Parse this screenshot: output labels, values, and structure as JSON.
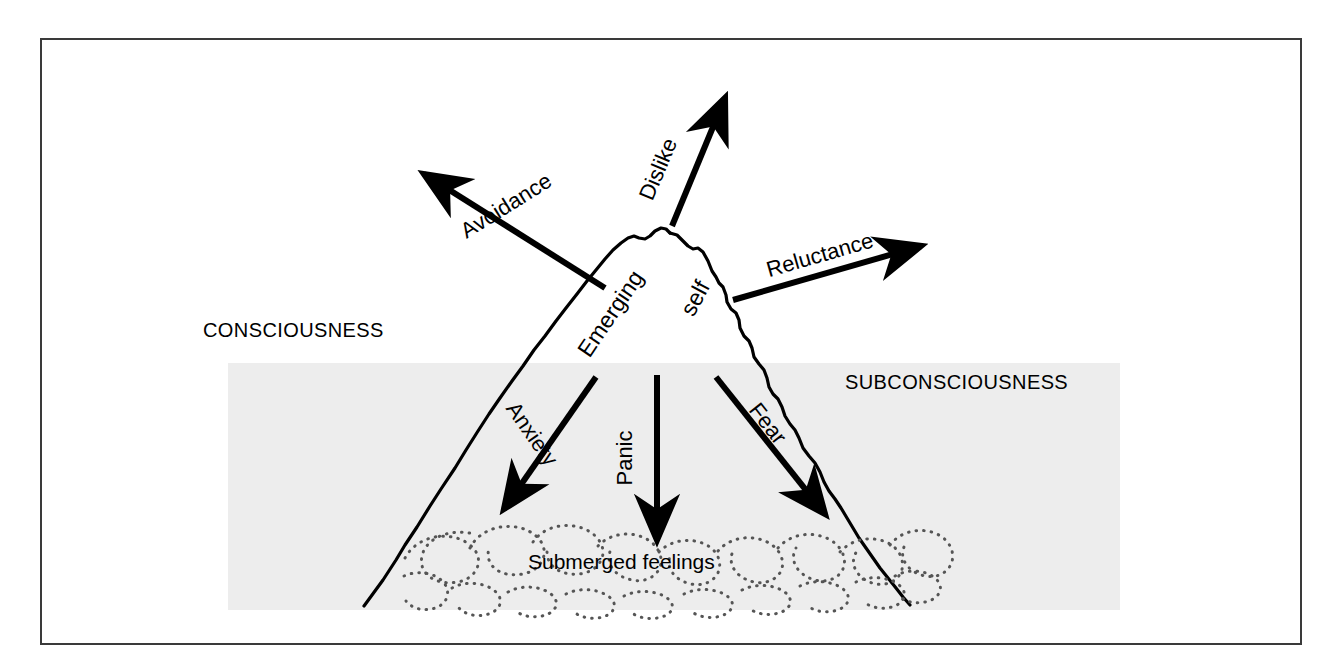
{
  "figure": {
    "type": "conceptual-diagram",
    "background_color": "#ffffff",
    "frame_color": "#3a3a3a",
    "band_color": "#ededed",
    "ink_color": "#000000"
  },
  "regions": {
    "consciousness_label": "CONSCIOUSNESS",
    "subconsciousness_label": "SUBCONSCIOUSNESS",
    "waterline_note": "horizontal grey band marks the subconscious zone"
  },
  "peak": {
    "label_part_one": "Emerging",
    "label_part_two": "self",
    "full_label": "Emerging self"
  },
  "submerged": {
    "label": "Submerged feelings"
  },
  "arrows_up": [
    {
      "label": "Avoidance",
      "direction": "up-left",
      "from": [
        605,
        288
      ],
      "to": [
        418,
        170
      ],
      "label_angle": -32
    },
    {
      "label": "Dislike",
      "direction": "up",
      "from": [
        672,
        226
      ],
      "to": [
        728,
        92
      ],
      "label_angle": -67
    },
    {
      "label": "Reluctance",
      "direction": "up-right",
      "from": [
        733,
        300
      ],
      "to": [
        928,
        243
      ],
      "label_angle": -16
    }
  ],
  "arrows_down": [
    {
      "label": "Anxiety",
      "direction": "down-left",
      "from": [
        596,
        377
      ],
      "to": [
        500,
        515
      ],
      "label_angle": 55
    },
    {
      "label": "Panic",
      "direction": "down",
      "from": [
        657,
        375
      ],
      "to": [
        657,
        546
      ],
      "label_angle": -90
    },
    {
      "label": "Fear",
      "direction": "down-right",
      "from": [
        716,
        377
      ],
      "to": [
        830,
        520
      ],
      "label_angle": 52
    }
  ]
}
